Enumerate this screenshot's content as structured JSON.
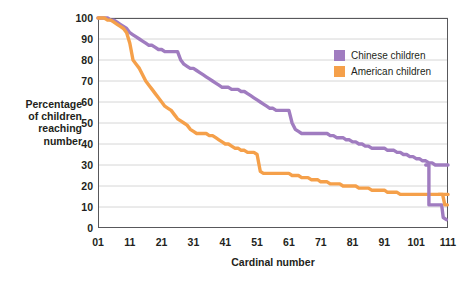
{
  "chart_data": {
    "type": "line",
    "title": "",
    "xlabel": "Cardinal number",
    "ylabel": "Percentage of children reaching number",
    "ylabel_lines": [
      "Percentage",
      "of children",
      "reaching",
      "number"
    ],
    "xlim": [
      1,
      111
    ],
    "ylim": [
      0,
      100
    ],
    "xticks": [
      "01",
      "11",
      "21",
      "31",
      "41",
      "51",
      "61",
      "71",
      "81",
      "91",
      "101",
      "111"
    ],
    "xtick_values": [
      1,
      11,
      21,
      31,
      41,
      51,
      61,
      71,
      81,
      91,
      101,
      111
    ],
    "yticks": [
      "0",
      "10",
      "20",
      "30",
      "40",
      "50",
      "60",
      "70",
      "80",
      "90",
      "100"
    ],
    "ytick_values": [
      0,
      10,
      20,
      30,
      40,
      50,
      60,
      70,
      80,
      90,
      100
    ],
    "grid": "horizontal",
    "legend_position": "top-right",
    "series": [
      {
        "name": "Chinese children",
        "color": "#a07cc0",
        "x": [
          1,
          2,
          3,
          4,
          5,
          6,
          7,
          8,
          9,
          10,
          11,
          12,
          13,
          14,
          15,
          16,
          17,
          18,
          19,
          20,
          21,
          22,
          23,
          24,
          25,
          26,
          27,
          28,
          29,
          30,
          31,
          32,
          33,
          34,
          35,
          36,
          37,
          38,
          39,
          40,
          41,
          42,
          43,
          44,
          45,
          46,
          47,
          48,
          49,
          50,
          51,
          52,
          53,
          54,
          55,
          56,
          57,
          58,
          59,
          60,
          61,
          62,
          63,
          64,
          65,
          66,
          67,
          68,
          69,
          70,
          71,
          72,
          73,
          74,
          75,
          76,
          77,
          78,
          79,
          80,
          81,
          82,
          83,
          84,
          85,
          86,
          87,
          88,
          89,
          90,
          91,
          92,
          93,
          94,
          95,
          96,
          97,
          98,
          99,
          100,
          101,
          102,
          103,
          104,
          105,
          106,
          107,
          108,
          109,
          110,
          111
        ],
        "values": [
          100,
          100,
          100,
          100,
          99,
          99,
          98,
          97,
          96,
          95,
          93,
          92,
          91,
          90,
          89,
          88,
          87,
          87,
          86,
          85,
          85,
          84,
          84,
          84,
          84,
          84,
          80,
          78,
          77,
          76,
          76,
          75,
          74,
          73,
          72,
          71,
          70,
          69,
          68,
          67,
          67,
          67,
          66,
          66,
          66,
          65,
          65,
          64,
          63,
          62,
          61,
          60,
          59,
          58,
          57,
          57,
          56,
          56,
          56,
          56,
          56,
          50,
          47,
          46,
          45,
          45,
          45,
          45,
          45,
          45,
          45,
          45,
          45,
          44,
          44,
          43,
          43,
          43,
          42,
          42,
          41,
          41,
          40,
          40,
          39,
          39,
          38,
          38,
          38,
          38,
          38,
          37,
          37,
          37,
          36,
          36,
          35,
          35,
          34,
          34,
          33,
          33,
          32,
          32,
          31,
          31,
          30,
          30,
          30,
          30,
          30
        ]
      },
      {
        "name": "American children",
        "color": "#f5a04a",
        "x": [
          1,
          2,
          3,
          4,
          5,
          6,
          7,
          8,
          9,
          10,
          11,
          12,
          13,
          14,
          15,
          16,
          17,
          18,
          19,
          20,
          21,
          22,
          23,
          24,
          25,
          26,
          27,
          28,
          29,
          30,
          31,
          32,
          33,
          34,
          35,
          36,
          37,
          38,
          39,
          40,
          41,
          42,
          43,
          44,
          45,
          46,
          47,
          48,
          49,
          50,
          51,
          52,
          53,
          54,
          55,
          56,
          57,
          58,
          59,
          60,
          61,
          62,
          63,
          64,
          65,
          66,
          67,
          68,
          69,
          70,
          71,
          72,
          73,
          74,
          75,
          76,
          77,
          78,
          79,
          80,
          81,
          82,
          83,
          84,
          85,
          86,
          87,
          88,
          89,
          90,
          91,
          92,
          93,
          94,
          95,
          96,
          97,
          98,
          99,
          100,
          101,
          102,
          103,
          104,
          105,
          106,
          107,
          108,
          109,
          110,
          111
        ],
        "values": [
          100,
          100,
          100,
          99,
          99,
          98,
          97,
          96,
          95,
          93,
          88,
          80,
          78,
          76,
          73,
          70,
          68,
          66,
          64,
          62,
          60,
          58,
          57,
          56,
          54,
          52,
          51,
          50,
          49,
          47,
          46,
          45,
          45,
          45,
          45,
          44,
          44,
          43,
          42,
          41,
          40,
          40,
          39,
          38,
          38,
          37,
          37,
          36,
          36,
          36,
          35,
          27,
          26,
          26,
          26,
          26,
          26,
          26,
          26,
          26,
          26,
          25,
          25,
          25,
          24,
          24,
          24,
          23,
          23,
          23,
          22,
          22,
          22,
          21,
          21,
          21,
          21,
          20,
          20,
          20,
          20,
          20,
          19,
          19,
          19,
          19,
          18,
          18,
          18,
          18,
          18,
          17,
          17,
          17,
          17,
          16,
          16,
          16,
          16,
          16,
          16,
          16,
          16,
          16,
          16,
          16,
          16,
          16,
          16,
          16,
          16
        ]
      }
    ],
    "annotations": {
      "chinese_endpoint_drop": "Chinese curve drops from ~30 to ~11 near 105 then to ~5 at 111",
      "american_endpoint_drop": "American curve drops from ~16 to ~11 near 109"
    }
  },
  "legend": {
    "items": [
      {
        "label": "Chinese children",
        "color": "#a07cc0"
      },
      {
        "label": "American children",
        "color": "#f5a04a"
      }
    ]
  },
  "axes": {
    "x_title": "Cardinal number",
    "y_title_lines": [
      "Percentage",
      "of children",
      "reaching",
      "number"
    ]
  },
  "style": {
    "plot_border": "#58585b",
    "gridline": "#d6d6d6",
    "background": "#ffffff",
    "text": "#231f20",
    "purple": "#a07cc0",
    "orange": "#f5a04a"
  }
}
